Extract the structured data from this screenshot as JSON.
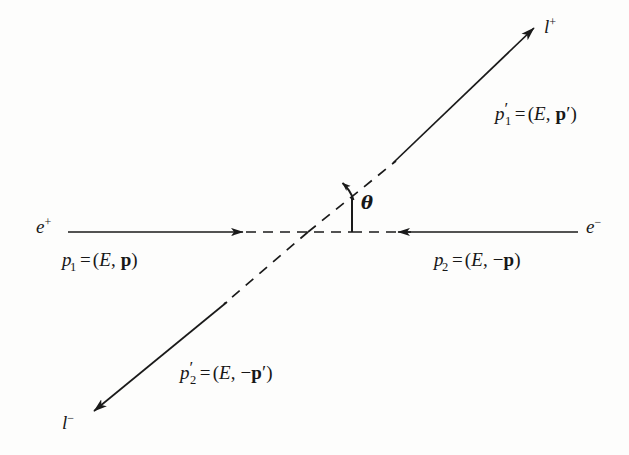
{
  "figure": {
    "name": "electron-positron-annihilation-to-lepton-pair",
    "background_color": "#fdfdfc",
    "ink_color": "#1a1a1a"
  },
  "particles": {
    "incoming_left": {
      "symbol": "e",
      "charge": "+"
    },
    "incoming_right": {
      "symbol": "e",
      "charge": "−"
    },
    "outgoing_upper": {
      "symbol": "l",
      "charge": "+"
    },
    "outgoing_lower": {
      "symbol": "l",
      "charge": "−"
    }
  },
  "momenta": {
    "p1": {
      "symbol": "p",
      "subscript": "1",
      "prime": "",
      "equals": "=",
      "open": "(",
      "energy": "E",
      "comma": ",",
      "sign": "",
      "vector": "p",
      "vector_prime": "",
      "close": ")"
    },
    "p2": {
      "symbol": "p",
      "subscript": "2",
      "prime": "",
      "equals": "=",
      "open": "(",
      "energy": "E",
      "comma": ",",
      "sign": "−",
      "vector": "p",
      "vector_prime": "",
      "close": ")"
    },
    "p1prime": {
      "symbol": "p",
      "subscript": "1",
      "prime": "′",
      "equals": "=",
      "open": "(",
      "energy": "E",
      "comma": ",",
      "sign": "",
      "vector": "p",
      "vector_prime": "′",
      "close": ")"
    },
    "p2prime": {
      "symbol": "p",
      "subscript": "2",
      "prime": "′",
      "equals": "=",
      "open": "(",
      "energy": "E",
      "comma": ",",
      "sign": "−",
      "vector": "p",
      "vector_prime": "′",
      "close": ")"
    }
  },
  "angle": {
    "symbol": "θ"
  }
}
